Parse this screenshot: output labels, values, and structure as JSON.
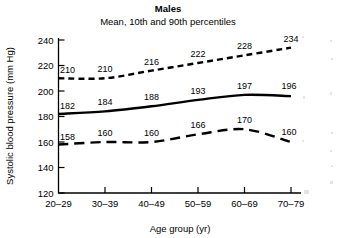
{
  "chart_data": {
    "type": "line",
    "title": "Males",
    "subtitle": "Mean, 10th and 90th percentiles",
    "xlabel": "Age group (yr)",
    "ylabel": "Systolic blood pressure (mm Hg)",
    "categories": [
      "20–29",
      "30–39",
      "40–49",
      "50–59",
      "60–69",
      "70–79"
    ],
    "ylim": [
      120,
      240
    ],
    "yticks": [
      120,
      140,
      160,
      180,
      200,
      220,
      240
    ],
    "ytick_labels": [
      "120",
      "140",
      "160",
      "180",
      "200",
      "220",
      "240"
    ],
    "grid": false,
    "legend": "none",
    "series": [
      {
        "name": "90th percentile",
        "style": "short-dashed",
        "values": [
          210,
          210,
          216,
          222,
          228,
          234
        ],
        "labels": [
          "210",
          "210",
          "216",
          "222",
          "228",
          "234"
        ]
      },
      {
        "name": "Mean",
        "style": "solid",
        "values": [
          182,
          184,
          188,
          193,
          197,
          196
        ],
        "labels": [
          "182",
          "184",
          "188",
          "193",
          "197",
          "196"
        ]
      },
      {
        "name": "10th percentile",
        "style": "long-dashed",
        "values": [
          158,
          160,
          160,
          166,
          170,
          160
        ],
        "labels": [
          "158",
          "160",
          "160",
          "166",
          "170",
          "160"
        ]
      }
    ]
  },
  "colors": {
    "ink": "#000000",
    "background": "#ffffff"
  }
}
